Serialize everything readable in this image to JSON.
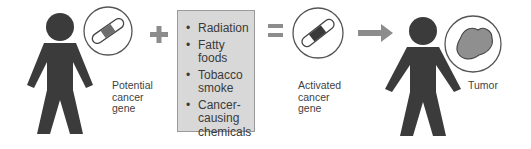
{
  "diagram": {
    "title": "",
    "stages": [
      {
        "id": "person-1",
        "label": "Potential cancer gene",
        "label_lines": [
          "Potential",
          "cancer",
          "gene"
        ]
      },
      {
        "id": "factors",
        "items": [
          {
            "lines": [
              "Radiation"
            ]
          },
          {
            "lines": [
              "Fatty foods"
            ]
          },
          {
            "lines": [
              "Tobacco",
              "smoke"
            ]
          },
          {
            "lines": [
              "Cancer-",
              "causing",
              "chemicals"
            ]
          }
        ]
      },
      {
        "id": "activated",
        "label": "Activated cancer gene",
        "label_lines": [
          "Activated",
          "cancer",
          "gene"
        ]
      },
      {
        "id": "person-2",
        "label": "Tumor",
        "label_lines": [
          "Tumor"
        ]
      }
    ],
    "operators": {
      "plus": "+",
      "equals": "=",
      "arrow": "→"
    },
    "bullet_glyph": "•",
    "colors": {
      "figure": "#3b3b3b",
      "operator": "#8c8c8c",
      "box_fill": "#d8d8d8",
      "box_border": "#9a9a9a",
      "gene_band_inactive": "#6e6e6e",
      "gene_band_active": "#3a3a3a",
      "tumor_fill": "#8f8f8f",
      "circle_stroke": "#555555"
    }
  }
}
